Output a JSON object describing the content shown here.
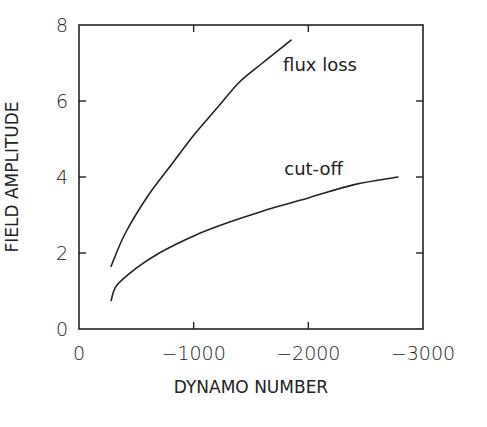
{
  "chart_data": {
    "type": "line",
    "title": "",
    "xlabel": "DYNAMO NUMBER",
    "ylabel": "FIELD AMPLITUDE",
    "xlim": [
      0,
      -3000
    ],
    "ylim": [
      0,
      8
    ],
    "x_ticks": [
      0,
      -1000,
      -2000,
      -3000
    ],
    "x_tick_labels": [
      "0",
      "−1000",
      "−2000",
      "−3000"
    ],
    "y_ticks": [
      0,
      2,
      4,
      6,
      8
    ],
    "y_tick_labels": [
      "0",
      "2",
      "4",
      "6",
      "8"
    ],
    "grid": false,
    "legend": null,
    "series": [
      {
        "name": "flux loss",
        "x": [
          -280,
          -400,
          -600,
          -800,
          -1000,
          -1200,
          -1400,
          -1600,
          -1850
        ],
        "y": [
          1.65,
          2.5,
          3.5,
          4.3,
          5.1,
          5.8,
          6.5,
          7.0,
          7.6
        ]
      },
      {
        "name": "cut-off",
        "x": [
          -280,
          -330,
          -500,
          -700,
          -1000,
          -1300,
          -1600,
          -2000,
          -2400,
          -2780
        ],
        "y": [
          0.75,
          1.15,
          1.6,
          2.0,
          2.45,
          2.8,
          3.1,
          3.45,
          3.8,
          4.0
        ]
      }
    ],
    "annotations": [
      {
        "text": "flux loss",
        "x": -1780,
        "y": 6.8
      },
      {
        "text": "cut-off",
        "x": -1790,
        "y": 4.05
      }
    ]
  }
}
